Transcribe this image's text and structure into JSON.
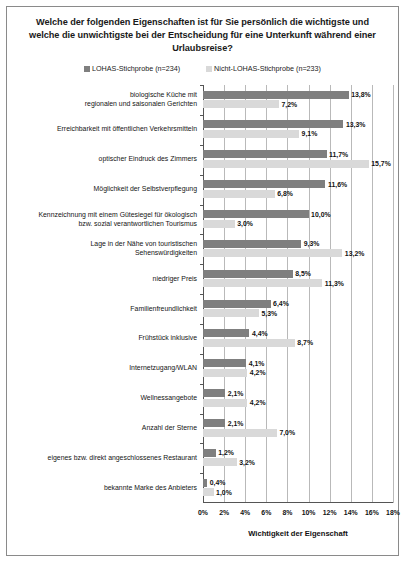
{
  "chart_data": {
    "type": "bar",
    "orientation": "horizontal",
    "title": "Welche der folgenden Eigenschaften ist für Sie persönlich die wichtigste und welche die unwichtigste bei der Entscheidung für eine Unterkunft während einer Urlaubsreise?",
    "xlabel": "Wichtigkeit der Eigenschaft",
    "ylabel": "",
    "xlim": [
      0,
      18
    ],
    "xticks": [
      0,
      2,
      4,
      6,
      8,
      10,
      12,
      14,
      16,
      18
    ],
    "xtick_labels": [
      "0%",
      "2%",
      "4%",
      "6%",
      "8%",
      "10%",
      "12%",
      "14%",
      "16%",
      "18%"
    ],
    "grid": true,
    "legend_position": "top",
    "categories": [
      "biologische Küche mit\nregionalen und saisonalen Gerichten",
      "Erreichbarkeit mit öffentlichen Verkehrsmitteln",
      "optischer Eindruck des Zimmers",
      "Möglichkeit der Selbstverpflegung",
      "Kennzeichnung mit einem Gütesiegel für ökologisch\nbzw. sozial verantwortlichen Tourismus",
      "Lage in der Nähe von touristischen\nSehenswürdigkeiten",
      "niedriger Preis",
      "Familienfreundlichkeit",
      "Frühstück inklusive",
      "Internetzugang/WLAN",
      "Wellnessangebote",
      "Anzahl der Sterne",
      "eigenes bzw. direkt angeschlossenes Restaurant",
      "bekannte Marke des Anbieters"
    ],
    "series": [
      {
        "name": "LOHAS-Stichprobe (n=234)",
        "color": "#7f7f7f",
        "values": [
          13.8,
          13.3,
          11.7,
          11.6,
          10.0,
          9.3,
          8.5,
          6.4,
          4.4,
          4.1,
          2.1,
          2.1,
          1.2,
          0.4
        ],
        "labels": [
          "13,8%",
          "13,3%",
          "11,7%",
          "11,6%",
          "10,0%",
          "9,3%",
          "8,5%",
          "6,4%",
          "4,4%",
          "4,1%",
          "2,1%",
          "2,1%",
          "1,2%",
          "0,4%"
        ]
      },
      {
        "name": "Nicht-LOHAS-Stichprobe (n=233)",
        "color": "#d9d9d9",
        "values": [
          7.2,
          9.1,
          15.7,
          6.8,
          3.0,
          13.2,
          11.3,
          5.3,
          8.7,
          4.2,
          4.2,
          7.0,
          3.2,
          1.0
        ],
        "labels": [
          "7,2%",
          "9,1%",
          "15,7%",
          "6,8%",
          "3,0%",
          "13,2%",
          "11,3%",
          "5,3%",
          "8,7%",
          "4,2%",
          "4,2%",
          "7,0%",
          "3,2%",
          "1,0%"
        ]
      }
    ]
  },
  "legend": {
    "items": [
      {
        "label": "LOHAS-Stichprobe (n=234)",
        "color": "#7f7f7f"
      },
      {
        "label": "Nicht-LOHAS-Stichprobe (n=233)",
        "color": "#d9d9d9"
      }
    ]
  }
}
